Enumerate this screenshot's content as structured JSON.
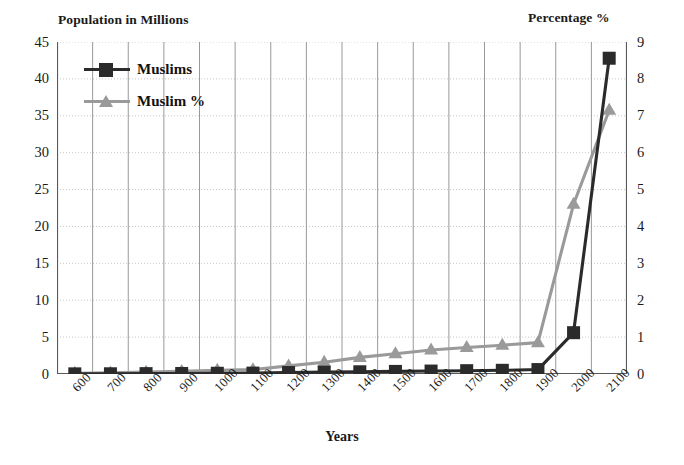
{
  "chart_data": {
    "type": "line",
    "title": "",
    "xlabel": "Years",
    "ylabel": "Population in Millions",
    "y2label": "Percentage %",
    "categories": [
      "600",
      "700",
      "800",
      "900",
      "1000",
      "1100",
      "1200",
      "1300",
      "1400",
      "1500",
      "1600",
      "1700",
      "1800",
      "1900",
      "2000",
      "2100"
    ],
    "ylim": [
      0,
      45
    ],
    "y2lim": [
      0,
      9
    ],
    "yticks": [
      "0",
      "5",
      "10",
      "15",
      "20",
      "25",
      "30",
      "35",
      "40",
      "45"
    ],
    "y2ticks": [
      "0",
      "1",
      "2",
      "3",
      "4",
      "5",
      "6",
      "7",
      "8",
      "9"
    ],
    "grid": true,
    "legend_position": "upper-left",
    "series": [
      {
        "name": "Muslims",
        "axis": "left",
        "color": "#2b2b2b",
        "marker": "square",
        "values": [
          0.02,
          0.03,
          0.05,
          0.07,
          0.1,
          0.12,
          0.2,
          0.25,
          0.3,
          0.35,
          0.4,
          0.45,
          0.5,
          0.6,
          5.6,
          42.8
        ]
      },
      {
        "name": "Muslim %",
        "axis": "right",
        "color": "#9a9a9a",
        "marker": "triangle",
        "values": [
          0.02,
          0.03,
          0.05,
          0.07,
          0.1,
          0.12,
          0.22,
          0.32,
          0.45,
          0.55,
          0.65,
          0.72,
          0.78,
          0.85,
          4.6,
          7.15
        ]
      }
    ]
  },
  "legend": {
    "items": [
      {
        "label": "Muslims"
      },
      {
        "label": "Muslim %"
      }
    ]
  }
}
